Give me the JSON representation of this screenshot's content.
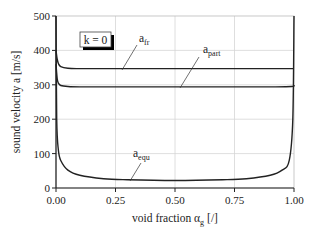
{
  "chart_data": {
    "type": "line",
    "title": "",
    "xlabel": "void fraction α_g [/]",
    "xlabel_main": "void fraction α",
    "xlabel_sub": "g",
    "xlabel_unit": "[/]",
    "ylabel": "sound velocity a [m/s]",
    "xlim": [
      0.0,
      1.0
    ],
    "ylim": [
      0,
      500
    ],
    "xticks": [
      "0.00",
      "0.25",
      "0.50",
      "0.75",
      "1.00"
    ],
    "yticks": [
      "0",
      "100",
      "200",
      "300",
      "400",
      "500"
    ],
    "grid": true,
    "annotation_box": "k = 0",
    "series": [
      {
        "name": "a_fr",
        "label_main": "a",
        "label_sub": "fr",
        "x": [
          0.0,
          0.005,
          0.01,
          0.02,
          0.05,
          0.1,
          0.25,
          0.5,
          0.75,
          0.9,
          1.0
        ],
        "y": [
          400,
          375,
          362,
          353,
          348,
          347,
          347,
          347,
          347,
          347,
          347
        ]
      },
      {
        "name": "a_part",
        "label_main": "a",
        "label_sub": "part",
        "x": [
          0.0,
          0.005,
          0.01,
          0.02,
          0.05,
          0.1,
          0.25,
          0.5,
          0.75,
          0.9,
          0.99,
          1.0
        ],
        "y": [
          360,
          318,
          305,
          298,
          295,
          294,
          294,
          294,
          294,
          294,
          295,
          300
        ]
      },
      {
        "name": "a_equ",
        "label_main": "a",
        "label_sub": "equ",
        "x": [
          0.0,
          0.003,
          0.01,
          0.02,
          0.05,
          0.1,
          0.2,
          0.3,
          0.5,
          0.7,
          0.8,
          0.9,
          0.95,
          0.98,
          0.995,
          1.0
        ],
        "y": [
          500,
          200,
          110,
          80,
          52,
          37,
          27,
          24,
          22,
          24,
          27,
          37,
          52,
          80,
          200,
          500
        ]
      }
    ]
  }
}
